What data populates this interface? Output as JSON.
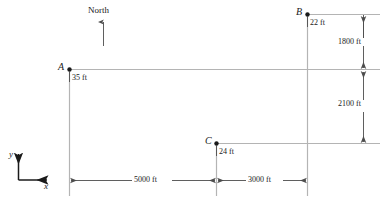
{
  "figure": {
    "type": "survey-plan-diagram",
    "compass": {
      "label": "North",
      "direction": "up"
    },
    "axes": {
      "x_label": "x",
      "y_label": "y"
    },
    "points": [
      {
        "name": "A",
        "elevation": "35 ft"
      },
      {
        "name": "B",
        "elevation": "22 ft"
      },
      {
        "name": "C",
        "elevation": "24 ft"
      }
    ],
    "horizontal_dimensions": [
      {
        "label": "5000 ft",
        "from": "A",
        "to": "C"
      },
      {
        "label": "3000 ft",
        "from": "C",
        "to": "B"
      }
    ],
    "vertical_dimensions": [
      {
        "label": "1800 ft",
        "from": "B",
        "to": "A"
      },
      {
        "label": "2100 ft",
        "from": "A",
        "to": "C"
      }
    ]
  },
  "colors": {
    "ink": "#1a1a1a",
    "construction_line": "#b4b4b4",
    "dimension_line": "#4d4d4d"
  }
}
